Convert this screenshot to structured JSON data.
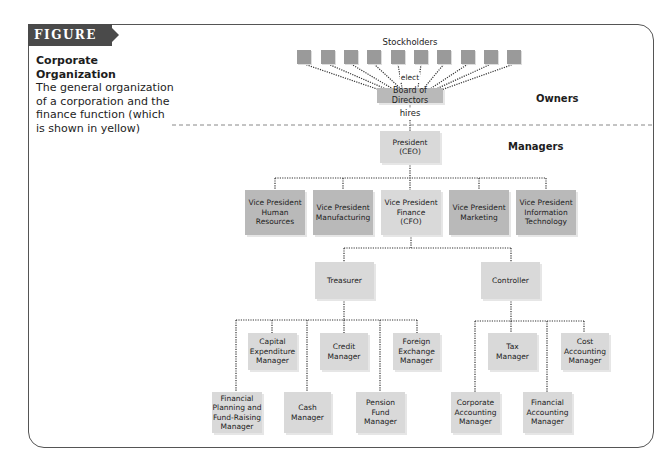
{
  "figure": {
    "label": "FIGURE 1.1",
    "caption_title": "Corporate Organization",
    "caption_text": "The general organization of a corporation and the finance function (which is shown in yellow)"
  },
  "sections": {
    "owners": "Owners",
    "managers": "Managers"
  },
  "annotations": {
    "stockholders": "Stockholders",
    "elect": "elect",
    "hires": "hires"
  },
  "colors": {
    "finance_fill": "#d9d9d9",
    "other_fill": "#b9b9b9",
    "stockholder_fill": "#9a9a9a",
    "frame": "#555555",
    "label_bg": "#4a4a4a"
  },
  "stockholders": {
    "count": 10
  },
  "nodes": {
    "board": "Board of Directors",
    "president": "President\n(CEO)",
    "vp_hr": "Vice President\nHuman\nResources",
    "vp_mfg": "Vice President\nManufacturing",
    "vp_fin": "Vice President\nFinance\n(CFO)",
    "vp_mkt": "Vice President\nMarketing",
    "vp_it": "Vice President\nInformation\nTechnology",
    "treasurer": "Treasurer",
    "controller": "Controller",
    "capex": "Capital\nExpenditure\nManager",
    "credit": "Credit\nManager",
    "fx": "Foreign\nExchange\nManager",
    "fpfr": "Financial\nPlanning and\nFund-Raising\nManager",
    "cash": "Cash\nManager",
    "pension": "Pension Fund\nManager",
    "tax": "Tax\nManager",
    "cost": "Cost\nAccounting\nManager",
    "corp_acct": "Corporate\nAccounting\nManager",
    "fin_acct": "Financial\nAccounting\nManager"
  }
}
